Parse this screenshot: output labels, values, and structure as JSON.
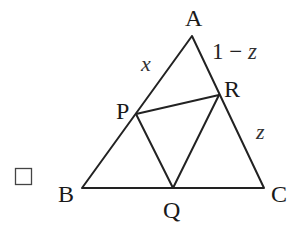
{
  "diagram": {
    "type": "triangle-with-inscribed-triangle",
    "outer_triangle": [
      "A",
      "B",
      "C"
    ],
    "inner_triangle": [
      "P",
      "Q",
      "R"
    ],
    "points": {
      "A": {
        "label": "A",
        "x": 192,
        "y": 36
      },
      "B": {
        "label": "B",
        "x": 82,
        "y": 188
      },
      "C": {
        "label": "C",
        "x": 264,
        "y": 188
      },
      "P": {
        "label": "P",
        "x": 136,
        "y": 114
      },
      "Q": {
        "label": "Q",
        "x": 173,
        "y": 188
      },
      "R": {
        "label": "R",
        "x": 219,
        "y": 95
      }
    },
    "segment_labels": {
      "AP": "x",
      "AR": "1 − z",
      "RC": "z"
    },
    "checkbox": {
      "checked": false
    }
  }
}
